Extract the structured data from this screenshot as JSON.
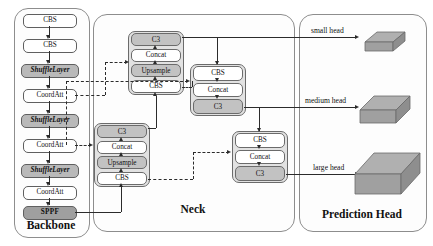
{
  "regions": {
    "backbone": {
      "label": "Backbone"
    },
    "neck": {
      "label": "Neck"
    },
    "prediction_head": {
      "label": "Prediction Head"
    }
  },
  "backbone": {
    "blocks": [
      {
        "label": "CBS",
        "style": "white"
      },
      {
        "label": "CBS",
        "style": "white"
      },
      {
        "label": "ShuffleLayer",
        "style": "shade"
      },
      {
        "label": "CoordAtt",
        "style": "white"
      },
      {
        "label": "ShuffleLayer",
        "style": "shade"
      },
      {
        "label": "CoordAtt",
        "style": "white"
      },
      {
        "label": "ShuffleLayer",
        "style": "shade"
      },
      {
        "label": "CoordAtt",
        "style": "white"
      },
      {
        "label": "SPPF",
        "style": "shade2"
      }
    ]
  },
  "neck": {
    "groups": [
      {
        "name": "upsample-group-top",
        "cells": [
          {
            "label": "C3",
            "style": "grey"
          },
          {
            "label": "Concat",
            "style": "white"
          },
          {
            "label": "Upsample",
            "style": "grey"
          },
          {
            "label": "CBS",
            "style": "white"
          }
        ]
      },
      {
        "name": "upsample-group-bottom",
        "cells": [
          {
            "label": "C3",
            "style": "grey"
          },
          {
            "label": "Concat",
            "style": "white"
          },
          {
            "label": "Upsample",
            "style": "grey"
          },
          {
            "label": "CBS",
            "style": "white"
          }
        ]
      },
      {
        "name": "downsample-group-middle",
        "cells": [
          {
            "label": "CBS",
            "style": "white"
          },
          {
            "label": "Concat",
            "style": "white"
          },
          {
            "label": "C3",
            "style": "grey"
          }
        ]
      },
      {
        "name": "downsample-group-large",
        "cells": [
          {
            "label": "CBS",
            "style": "white"
          },
          {
            "label": "Concat",
            "style": "white"
          },
          {
            "label": "C3",
            "style": "grey"
          }
        ]
      }
    ]
  },
  "prediction_head": {
    "heads": [
      {
        "label": "small head"
      },
      {
        "label": "medium head"
      },
      {
        "label": "large head"
      }
    ]
  }
}
